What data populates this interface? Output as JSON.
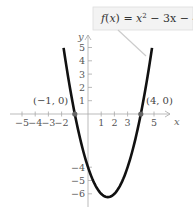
{
  "chart_data": {
    "type": "line",
    "title": "",
    "function_label": "f(x) = x² − 3x − 4",
    "function_label_parts": {
      "f": "f",
      "x": "x",
      "eq": " = ",
      "xsq": "x",
      "exp": "2",
      "rest": " − 3x − 4"
    },
    "xlabel": "x",
    "ylabel": "y",
    "xlim": [
      -5.5,
      6
    ],
    "ylim": [
      -6.8,
      5.8
    ],
    "x_ticks": [
      -5,
      -4,
      -3,
      -2,
      1,
      2,
      3,
      5
    ],
    "x_tick_labels": [
      "−5",
      "−4",
      "−3",
      "−2",
      "1",
      "2",
      "3",
      "5"
    ],
    "y_ticks": [
      5,
      4,
      3,
      2,
      1,
      -4,
      -5,
      -6
    ],
    "y_tick_labels": [
      "5",
      "4",
      "3",
      "2",
      "1",
      "−4",
      "−5",
      "−6"
    ],
    "series": [
      {
        "name": "f(x) = x^2 - 3x - 4",
        "x": [
          -1.85,
          -1.5,
          -1,
          -0.5,
          0,
          0.5,
          1,
          1.5,
          2,
          2.5,
          3,
          3.5,
          4,
          4.5,
          4.85
        ],
        "values": [
          5,
          2.75,
          0,
          -2.25,
          -4,
          -5.25,
          -6,
          -6.25,
          -6,
          -5.25,
          -4,
          -2.25,
          0,
          2.75,
          5
        ]
      }
    ],
    "points": [
      {
        "label": "(−1, 0)",
        "x": -1,
        "y": 0
      },
      {
        "label": "(4, 0)",
        "x": 4,
        "y": 0
      }
    ],
    "vertex": {
      "x": 1.5,
      "y": -6.25
    },
    "grid": false,
    "legend": "callout box top-right"
  }
}
